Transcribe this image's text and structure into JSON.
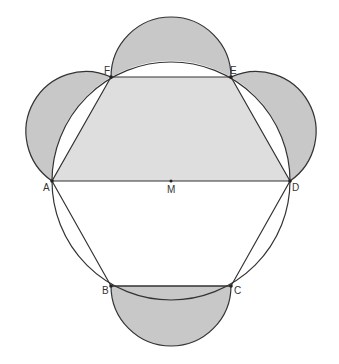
{
  "diagram": {
    "type": "geometry",
    "colors": {
      "background": "#ffffff",
      "stroke": "#333333",
      "semicircle_fill": "#c8c8c8",
      "trapezoid_fill": "#dedede"
    },
    "points": {
      "A": {
        "label": "A",
        "x": 52,
        "y": 181
      },
      "B": {
        "label": "B",
        "x": 111,
        "y": 286
      },
      "C": {
        "label": "C",
        "x": 231,
        "y": 286
      },
      "D": {
        "label": "D",
        "x": 290,
        "y": 181
      },
      "E": {
        "label": "E",
        "x": 231,
        "y": 77
      },
      "F": {
        "label": "F",
        "x": 111,
        "y": 77
      },
      "M": {
        "label": "M",
        "x": 171,
        "y": 181
      }
    },
    "circle": {
      "center": "M",
      "radius": 119
    },
    "shaded_regions": [
      "semicircle on AF",
      "semicircle on FE",
      "semicircle on ED",
      "semicircle on BC",
      "trapezoid AFED"
    ]
  }
}
